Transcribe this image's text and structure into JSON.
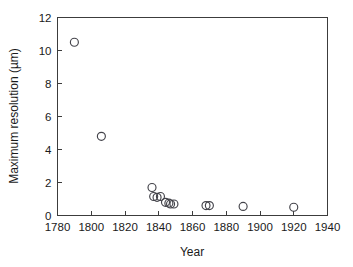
{
  "chart_data": {
    "type": "scatter",
    "title": "",
    "xlabel": "Year",
    "ylabel": "Maximum resolution (µm)",
    "xlim": [
      1780,
      1940
    ],
    "ylim": [
      0,
      12
    ],
    "xticks": [
      1780,
      1800,
      1820,
      1840,
      1860,
      1880,
      1900,
      1920,
      1940
    ],
    "yticks": [
      0,
      2,
      4,
      6,
      8,
      10,
      12
    ],
    "xtick_labels": [
      "1780",
      "1800",
      "1820",
      "1840",
      "1860",
      "1880",
      "1900",
      "1920",
      "1940"
    ],
    "ytick_labels": [
      "0",
      "2",
      "4",
      "6",
      "8",
      "10",
      "12"
    ],
    "grid": false,
    "legend": null,
    "marker_style": "open-circle",
    "marker_color": "#43434a",
    "marker_radius_px": 4.0,
    "series": [
      {
        "name": "Maximum resolution",
        "x": [
          1790,
          1806,
          1836,
          1837,
          1839,
          1841,
          1844,
          1846,
          1847,
          1849,
          1868,
          1870,
          1890,
          1920
        ],
        "y": [
          10.5,
          4.8,
          1.7,
          1.15,
          1.1,
          1.15,
          0.8,
          0.75,
          0.7,
          0.7,
          0.6,
          0.6,
          0.55,
          0.5
        ]
      }
    ]
  },
  "figure": {
    "background_color": "#ffffff",
    "axis_color": "#3c3c3c",
    "text_color": "#1a1a1a"
  }
}
